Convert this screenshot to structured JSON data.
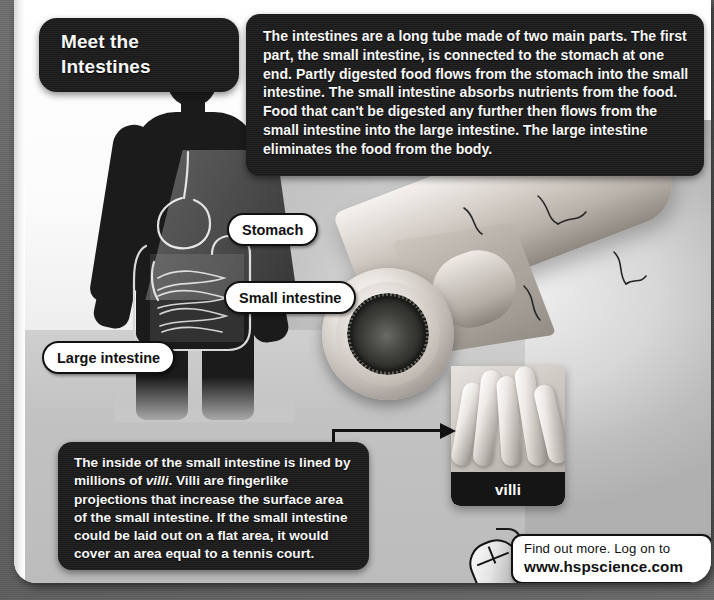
{
  "page": {
    "title_lines": [
      "Meet the",
      "Intestines"
    ]
  },
  "intro": {
    "text": "The intestines are a long tube made of two main parts. The first part, the small intestine, is connected to the stomach at one end. Partly digested food flows from the stomach into the small intestine. The small intestine absorbs nutrients from the food. Food that can't be digested any further then flows from the small intestine into the large intestine. The large intestine eliminates the food from the body."
  },
  "villi_note": {
    "part1": "The inside of the small intestine is lined by millions of ",
    "emphasis": "villi",
    "part2": ". Villi are fingerlike projections that increase the surface area of the small intestine. If the small intestine could be laid out on a flat area, it would cover an area equal to a tennis court."
  },
  "callouts": {
    "stomach": "Stomach",
    "small_intestine": "Small intestine",
    "large_intestine": "Large intestine",
    "villi_panel": "villi"
  },
  "find_out_more": {
    "line1": "Find out more. Log on to",
    "line2": "www.hspscience.com"
  },
  "colors": {
    "dark_box": "#1c1c1c",
    "text_on_dark": "#ffffff",
    "pill_bg": "#ffffff",
    "pill_border": "#111111",
    "mat": "#6b6b6b",
    "sheet": "#ffffff"
  }
}
